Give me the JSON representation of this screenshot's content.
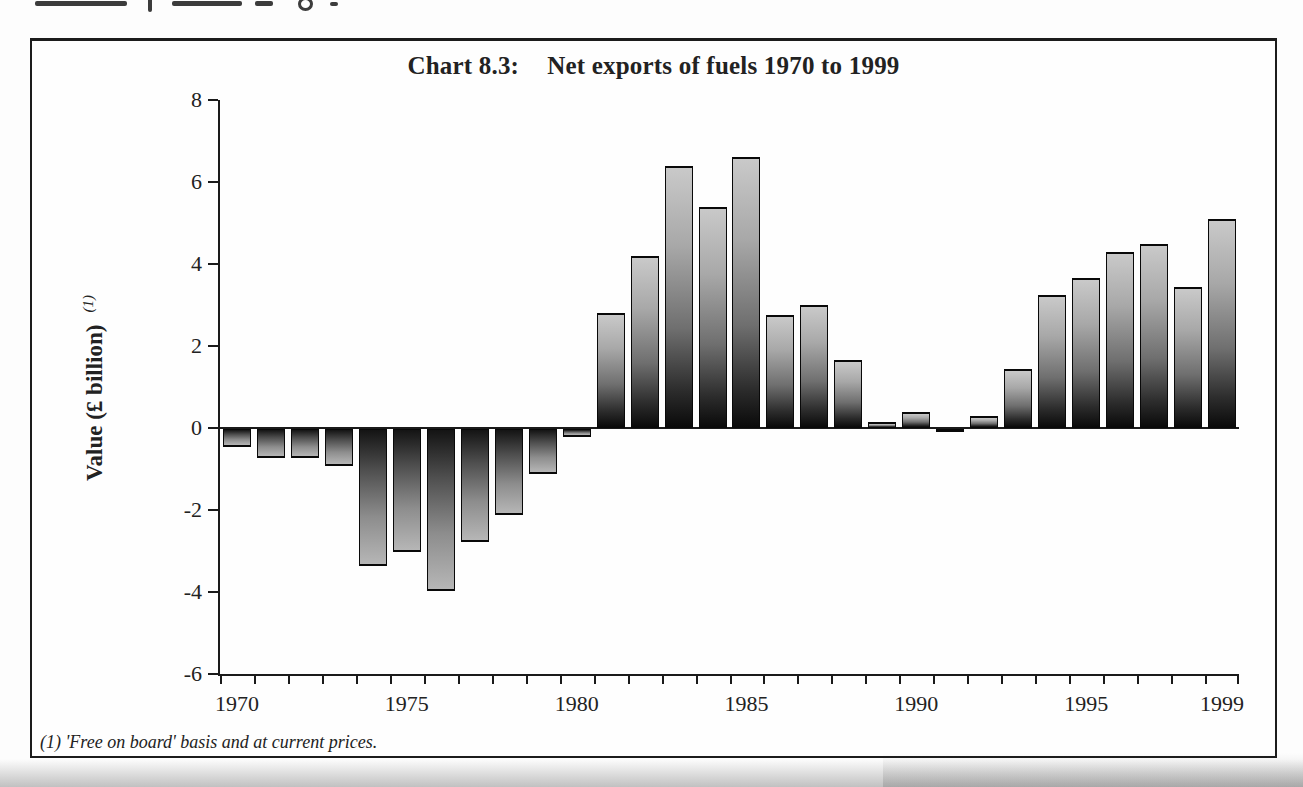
{
  "title": {
    "prefix": "Chart 8.3:",
    "text": "Net exports of fuels 1970 to 1999"
  },
  "y_axis": {
    "label": "Value (£ billion)",
    "footnote_marker": "(1)",
    "ticks": [
      "8",
      "6",
      "4",
      "2",
      "0",
      "-2",
      "-4",
      "-6"
    ],
    "tick_values": [
      8,
      6,
      4,
      2,
      0,
      -2,
      -4,
      -6
    ]
  },
  "x_axis": {
    "tick_labels": [
      "1970",
      "1975",
      "1980",
      "1985",
      "1990",
      "1995",
      "1999"
    ],
    "label_slots": [
      0,
      5,
      10,
      15,
      20,
      25,
      29
    ]
  },
  "footnote": "(1) 'Free on board' basis and at current prices.",
  "colors": {
    "ink": "#1c1c1c",
    "bar_positive_gradient_top": "#c9c9c9",
    "bar_positive_gradient_bottom": "#0a0a0a",
    "bar_negative_gradient_top": "#141414",
    "bar_negative_gradient_bottom": "#b6b6b6",
    "background": "#fefefe"
  },
  "chart_data": {
    "type": "bar",
    "xlabel": "",
    "ylabel": "Value (£ billion)",
    "ylim": [
      -6,
      8
    ],
    "grid": false,
    "legend": false,
    "categories": [
      1970,
      1971,
      1972,
      1973,
      1974,
      1975,
      1976,
      1977,
      1978,
      1979,
      1980,
      1981,
      1982,
      1983,
      1984,
      1985,
      1986,
      1987,
      1988,
      1989,
      1990,
      1991,
      1992,
      1993,
      1994,
      1995,
      1996,
      1997,
      1998,
      1999
    ],
    "values": [
      -0.45,
      -0.7,
      -0.7,
      -0.9,
      -3.35,
      -3.0,
      -3.95,
      -2.75,
      -2.1,
      -1.1,
      -0.2,
      2.8,
      4.2,
      6.4,
      5.4,
      6.6,
      2.75,
      3.0,
      1.65,
      0.15,
      0.4,
      -0.05,
      0.3,
      1.45,
      3.25,
      3.65,
      4.3,
      4.5,
      3.45,
      5.1
    ]
  }
}
